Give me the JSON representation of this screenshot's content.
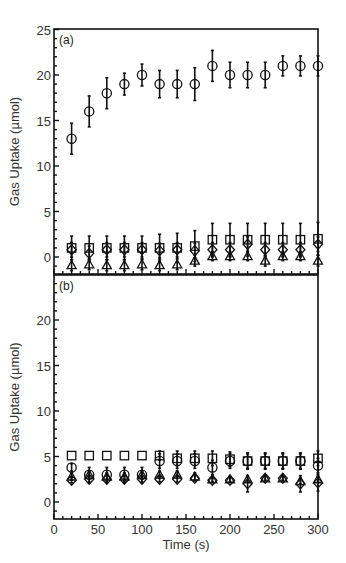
{
  "chart_data": [
    {
      "type": "scatter",
      "panel_label": "(a)",
      "title": "",
      "xlabel": "Time (s)",
      "ylabel": "Gas Uptake (µmol)",
      "xlim": [
        0,
        300
      ],
      "ylim": [
        -2,
        25
      ],
      "xticks": [
        0,
        50,
        100,
        150,
        200,
        250,
        300
      ],
      "yticks": [
        0,
        5,
        10,
        15,
        20,
        25
      ],
      "x": [
        20,
        40,
        60,
        80,
        100,
        120,
        140,
        160,
        180,
        200,
        220,
        240,
        260,
        280,
        300
      ],
      "series": [
        {
          "name": "circle",
          "marker": "circle",
          "values": [
            13,
            16,
            18,
            19,
            20,
            19,
            19,
            19,
            21,
            20,
            20,
            20,
            21,
            21,
            21
          ],
          "errors": [
            1.7,
            1.7,
            1.7,
            1.2,
            1.2,
            1.5,
            1.5,
            1.8,
            1.7,
            1.4,
            1.4,
            1.4,
            1.1,
            1.1,
            1.1
          ]
        },
        {
          "name": "square",
          "marker": "square",
          "values": [
            1,
            1,
            1,
            1,
            1,
            1,
            1,
            1.2,
            1.9,
            1.9,
            1.9,
            1.9,
            1.9,
            1.9,
            2
          ],
          "errors": [
            1.3,
            1.3,
            1.3,
            1.3,
            1.3,
            1.5,
            1.6,
            1.7,
            1.8,
            1.8,
            1.8,
            1.8,
            1.8,
            1.8,
            1.8
          ]
        },
        {
          "name": "diamond",
          "marker": "diamond",
          "values": [
            0.8,
            0.4,
            0.8,
            0.8,
            0.8,
            0.7,
            0.8,
            0.7,
            0.8,
            0.8,
            1.4,
            0.8,
            0.8,
            0.8,
            1.4
          ],
          "errors": [
            0.8,
            0.8,
            0.8,
            0.8,
            0.8,
            0.8,
            0.8,
            0.8,
            0.8,
            0.8,
            0.8,
            0.8,
            0.8,
            0.8,
            0.8
          ]
        },
        {
          "name": "triangle",
          "marker": "triangle",
          "values": [
            -0.9,
            -0.8,
            -0.9,
            -0.9,
            -0.8,
            -0.9,
            -0.8,
            -0.4,
            0.1,
            0.1,
            0.1,
            -0.4,
            0.1,
            0.1,
            -0.4
          ],
          "errors": [
            0.6,
            0.6,
            0.6,
            0.6,
            0.6,
            0.6,
            0.6,
            0.6,
            0.5,
            0.5,
            0.5,
            0.6,
            0.5,
            0.5,
            0.6
          ]
        }
      ],
      "grid": false,
      "legend": "none"
    },
    {
      "type": "scatter",
      "panel_label": "(b)",
      "title": "",
      "xlabel": "Time (s)",
      "ylabel": "Gas Uptake (µmol)",
      "xlim": [
        0,
        300
      ],
      "ylim": [
        -2,
        25
      ],
      "xticks": [
        0,
        50,
        100,
        150,
        200,
        250,
        300
      ],
      "yticks": [
        0,
        5,
        10,
        15,
        20
      ],
      "x": [
        20,
        40,
        60,
        80,
        100,
        120,
        140,
        160,
        180,
        200,
        220,
        240,
        260,
        280,
        300
      ],
      "series": [
        {
          "name": "square",
          "marker": "square",
          "values": [
            5.1,
            5.1,
            5.1,
            5.1,
            5.1,
            5.1,
            4.8,
            4.8,
            4.8,
            4.7,
            4.5,
            4.5,
            4.5,
            4.5,
            4.8
          ],
          "errors": [
            0,
            0,
            0,
            0,
            0,
            0.5,
            0.8,
            0.8,
            0.8,
            0.8,
            0.9,
            0.9,
            0.9,
            0.9,
            0.8
          ]
        },
        {
          "name": "circle",
          "marker": "circle",
          "values": [
            3.8,
            3,
            3,
            3,
            3,
            4.5,
            4.5,
            4.5,
            3.8,
            4.5,
            4.5,
            4.5,
            4.5,
            4.5,
            4
          ],
          "errors": [
            0.4,
            0.8,
            0.8,
            0.8,
            0.8,
            0.8,
            0.8,
            0.8,
            0.8,
            0.8,
            0.8,
            0.8,
            0.8,
            0.8,
            0.8
          ]
        },
        {
          "name": "triangle",
          "marker": "triangle",
          "values": [
            2.8,
            3,
            2.8,
            2.8,
            3,
            3,
            3,
            2.8,
            2.5,
            2.5,
            2.5,
            2.6,
            2.6,
            2.3,
            2.5
          ],
          "errors": [
            0.4,
            0.4,
            0.4,
            0.4,
            0.4,
            0.4,
            0.4,
            0.4,
            0.3,
            0.3,
            0.3,
            0.3,
            0.3,
            0.3,
            0.3
          ]
        },
        {
          "name": "diamond",
          "marker": "diamond",
          "values": [
            2.4,
            2.5,
            2.5,
            2.5,
            2.5,
            2.5,
            2.5,
            2.6,
            2.4,
            2.4,
            2,
            2.6,
            2.6,
            2,
            2.1
          ],
          "errors": [
            0.3,
            0.4,
            0.4,
            0.4,
            0.4,
            0.3,
            0.3,
            0.3,
            0.2,
            0.2,
            0.9,
            0.2,
            0.2,
            0.9,
            0.9
          ]
        }
      ],
      "grid": false,
      "legend": "none"
    }
  ],
  "layout": {
    "x_px": [
      54,
      318
    ],
    "panels": [
      {
        "y0_px": 257,
        "px_per_unit": 9.1,
        "top_px": 29,
        "bottom_px": 274
      },
      {
        "y0_px": 502,
        "px_per_unit": 9.1,
        "top_px": 275,
        "bottom_px": 519
      }
    ]
  },
  "labels": {
    "xlabel": "Time (s)",
    "ylabel_a": "Gas Uptake (µmol)",
    "ylabel_b": "Gas Uptake (µmol)",
    "panel_a": "(a)",
    "panel_b": "(b)"
  }
}
